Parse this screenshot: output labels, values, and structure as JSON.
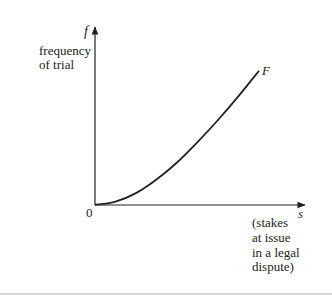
{
  "chart_data": {
    "type": "line",
    "title": "",
    "xlabel": "s",
    "xlabel_description": [
      "(stakes",
      "at issue",
      "in a legal",
      "dispute)"
    ],
    "ylabel": "f",
    "ylabel_description": [
      "frequency",
      "of trial"
    ],
    "origin_label": "0",
    "series": [
      {
        "name": "F",
        "shape": "convex increasing",
        "x": [
          0,
          0.1,
          0.2,
          0.3,
          0.4,
          0.5,
          0.6,
          0.7,
          0.8
        ],
        "y": [
          0,
          0.02,
          0.07,
          0.15,
          0.25,
          0.37,
          0.5,
          0.64,
          0.79
        ]
      }
    ],
    "xlim": [
      0,
      1
    ],
    "ylim": [
      0,
      1
    ],
    "grid": false,
    "legend": "none"
  },
  "colors": {
    "ink": "#222222",
    "background": "#ffffff"
  }
}
